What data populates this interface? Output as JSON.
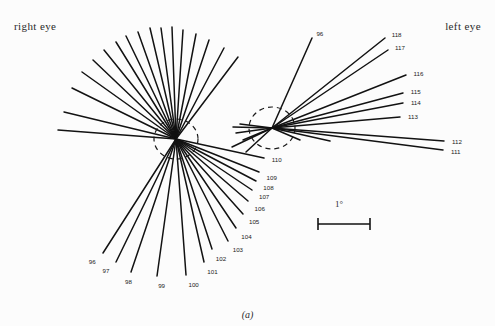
{
  "figure": {
    "caption": "(a)",
    "right_eye_label": "right eye",
    "left_eye_label": "left eye",
    "scale_bar_label": "1°",
    "line_color": "#121212",
    "background_color": "#fcfcfc",
    "dashed_circle_color": "#1a1a1a"
  },
  "chart_data": {
    "type": "scatter",
    "title": "",
    "subtitle": "",
    "xlabel": "",
    "ylabel": "",
    "grid": false,
    "legend_position": "none",
    "annotations": [
      "right eye",
      "left eye",
      "1°",
      "(a)"
    ],
    "scale_bar": {
      "label": "1°",
      "x1": 318,
      "x2": 370,
      "y": 224
    },
    "hubs": [
      {
        "name": "right-eye-hub",
        "cx": 176,
        "cy": 139,
        "circle_rx": 22,
        "circle_ry": 20
      },
      {
        "name": "left-eye-hub",
        "cx": 272,
        "cy": 128,
        "circle_rx": 23,
        "circle_ry": 21
      }
    ],
    "series": [
      {
        "name": "right-eye-orientations",
        "hub": "right-eye-hub",
        "values": [
          {
            "label": "",
            "x2": 72,
            "y2": 88
          },
          {
            "label": "",
            "x2": 64,
            "y2": 112
          },
          {
            "label": "",
            "x2": 58,
            "y2": 130
          },
          {
            "label": "",
            "x2": 82,
            "y2": 72
          },
          {
            "label": "",
            "x2": 93,
            "y2": 60
          },
          {
            "label": "",
            "x2": 104,
            "y2": 50
          },
          {
            "label": "",
            "x2": 116,
            "y2": 42
          },
          {
            "label": "",
            "x2": 126,
            "y2": 36
          },
          {
            "label": "",
            "x2": 138,
            "y2": 32
          },
          {
            "label": "",
            "x2": 150,
            "y2": 28
          },
          {
            "label": "",
            "x2": 161,
            "y2": 28
          },
          {
            "label": "",
            "x2": 172,
            "y2": 27
          },
          {
            "label": "",
            "x2": 183,
            "y2": 30
          },
          {
            "label": "",
            "x2": 196,
            "y2": 34
          },
          {
            "label": "",
            "x2": 209,
            "y2": 40
          },
          {
            "label": "",
            "x2": 224,
            "y2": 48
          },
          {
            "label": "",
            "x2": 238,
            "y2": 57
          },
          {
            "label": "96",
            "x2": 103,
            "y2": 253
          },
          {
            "label": "97",
            "x2": 116,
            "y2": 262
          },
          {
            "label": "98",
            "x2": 131,
            "y2": 272
          },
          {
            "label": "99",
            "x2": 157,
            "y2": 276
          },
          {
            "label": "100",
            "x2": 186,
            "y2": 275
          },
          {
            "label": "101",
            "x2": 204,
            "y2": 262
          },
          {
            "label": "102",
            "x2": 212,
            "y2": 249
          },
          {
            "label": "103",
            "x2": 228,
            "y2": 241
          },
          {
            "label": "104",
            "x2": 236,
            "y2": 228
          },
          {
            "label": "105",
            "x2": 243,
            "y2": 214
          },
          {
            "label": "106",
            "x2": 248,
            "y2": 201
          },
          {
            "label": "107",
            "x2": 252,
            "y2": 190
          },
          {
            "label": "108",
            "x2": 256,
            "y2": 181
          },
          {
            "label": "109",
            "x2": 259,
            "y2": 172
          },
          {
            "label": "110",
            "x2": 264,
            "y2": 158
          }
        ]
      },
      {
        "name": "left-eye-orientations",
        "hub": "left-eye-hub",
        "values": [
          {
            "label": "96",
            "x2": 312,
            "y2": 38
          },
          {
            "label": "111",
            "x2": 443,
            "y2": 150
          },
          {
            "label": "112",
            "x2": 444,
            "y2": 141
          },
          {
            "label": "113",
            "x2": 400,
            "y2": 117
          },
          {
            "label": "114",
            "x2": 403,
            "y2": 103
          },
          {
            "label": "115",
            "x2": 403,
            "y2": 93
          },
          {
            "label": "116",
            "x2": 406,
            "y2": 75
          },
          {
            "label": "117",
            "x2": 388,
            "y2": 50
          },
          {
            "label": "118",
            "x2": 385,
            "y2": 38
          },
          {
            "label": "",
            "x2": 240,
            "y2": 124
          },
          {
            "label": "",
            "x2": 233,
            "y2": 127
          },
          {
            "label": "",
            "x2": 236,
            "y2": 133
          },
          {
            "label": "",
            "x2": 243,
            "y2": 140
          },
          {
            "label": "",
            "x2": 232,
            "y2": 147
          },
          {
            "label": "",
            "x2": 246,
            "y2": 152
          },
          {
            "label": "",
            "x2": 300,
            "y2": 140
          },
          {
            "label": "",
            "x2": 330,
            "y2": 141
          }
        ]
      }
    ]
  }
}
